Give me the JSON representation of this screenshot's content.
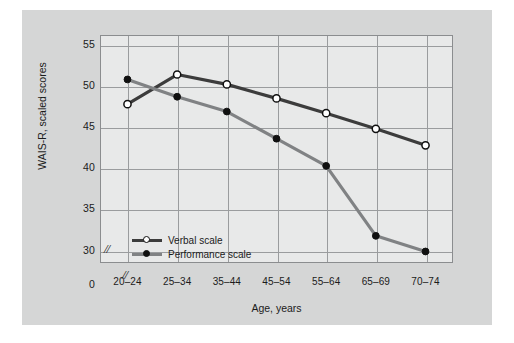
{
  "chart_data": {
    "type": "line",
    "title": "",
    "xlabel": "Age, years",
    "ylabel": "WAIS-R, scaled scores",
    "categories": [
      "20–24",
      "25–34",
      "35–44",
      "45–54",
      "55–64",
      "65–69",
      "70–74"
    ],
    "yticks": [
      30,
      35,
      40,
      45,
      50,
      55
    ],
    "ylim": [
      28.5,
      56.2
    ],
    "origin_label": "0",
    "axis_break_symbol": "//",
    "grid": true,
    "legend_position": "inside-bottom-left",
    "series": [
      {
        "name": "Verbal scale",
        "marker": "open-circle",
        "color": "#3c3c3c",
        "values": [
          47.8,
          51.4,
          50.2,
          48.5,
          46.7,
          44.8,
          42.8
        ]
      },
      {
        "name": "Performance scale",
        "marker": "filled-circle",
        "color": "#808284",
        "values": [
          50.8,
          48.7,
          46.9,
          43.6,
          40.3,
          31.8,
          29.9
        ]
      }
    ]
  },
  "colors": {
    "figure_background": "#ffffff",
    "panel_background": "#d5d6d6",
    "plot_background": "#e8e9e9",
    "grid": "#9a9c9e",
    "frame": "#8b8d8f",
    "text": "#1b1b1b",
    "verbal_series": "#3c3c3c",
    "performance_series": "#808284"
  }
}
